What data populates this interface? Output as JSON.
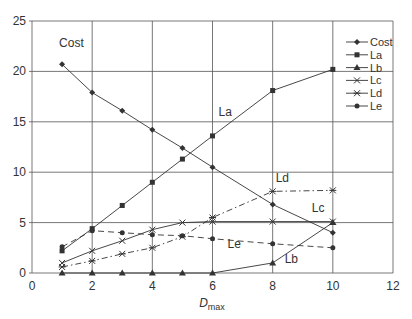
{
  "chart_data": {
    "type": "line",
    "title": "",
    "xlabel": "D",
    "xlabel_sub": "max",
    "ylabel": "",
    "xlim": [
      0,
      12
    ],
    "ylim": [
      0,
      25
    ],
    "xticks": [
      0,
      2,
      4,
      6,
      8,
      10,
      12
    ],
    "yticks": [
      0,
      5,
      10,
      15,
      20,
      25
    ],
    "grid": true,
    "legend_position": "upper right (inside plot)",
    "x": [
      1,
      2,
      3,
      4,
      5,
      6,
      8,
      10
    ],
    "series": [
      {
        "name": "Cost",
        "marker": "diamond",
        "dash": "solid",
        "values": [
          20.7,
          17.9,
          16.1,
          14.2,
          12.4,
          10.5,
          6.8,
          4.0
        ]
      },
      {
        "name": "La",
        "marker": "square",
        "dash": "solid",
        "values": [
          2.2,
          4.4,
          6.7,
          9.0,
          11.3,
          13.6,
          18.1,
          20.2
        ]
      },
      {
        "name": "Lb",
        "marker": "triangle",
        "dash": "solid",
        "values": [
          0,
          0,
          0,
          0,
          0,
          0,
          1.0,
          5.0
        ]
      },
      {
        "name": "Lc",
        "marker": "x",
        "dash": "solid",
        "values": [
          1.0,
          2.2,
          3.2,
          4.3,
          5.0,
          5.1,
          5.1,
          5.1
        ]
      },
      {
        "name": "Ld",
        "marker": "star",
        "dash": "dashdot",
        "values": [
          0.6,
          1.2,
          1.9,
          2.5,
          3.6,
          5.5,
          8.1,
          8.2
        ]
      },
      {
        "name": "Le",
        "marker": "circle",
        "dash": "dashed",
        "values": [
          2.6,
          4.2,
          4.0,
          3.8,
          3.7,
          3.4,
          2.9,
          2.5
        ]
      }
    ],
    "annotations": [
      {
        "text": "Cost",
        "x": 0.9,
        "y": 22.4
      },
      {
        "text": "La",
        "x": 6.2,
        "y": 15.6
      },
      {
        "text": "Ld",
        "x": 8.1,
        "y": 9.0
      },
      {
        "text": "Lc",
        "x": 9.3,
        "y": 6.1
      },
      {
        "text": "Le",
        "x": 6.5,
        "y": 2.5
      },
      {
        "text": "Lb",
        "x": 8.4,
        "y": 1.0
      }
    ]
  },
  "colors": {
    "grid": "#555555",
    "line": "#333333",
    "text": "#333333",
    "background": "#ffffff"
  }
}
